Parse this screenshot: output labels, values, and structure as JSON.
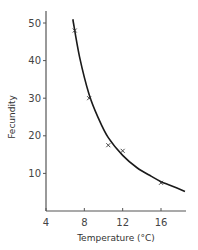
{
  "chart_data": {
    "type": "line",
    "title": "",
    "xlabel": "Temperature (°C)",
    "ylabel": "Fecundity",
    "xlim": [
      4,
      19
    ],
    "ylim": [
      0,
      53
    ],
    "x_ticks": [
      4,
      8,
      12,
      16
    ],
    "y_ticks": [
      10,
      20,
      30,
      40,
      50
    ],
    "grid": false,
    "legend": null,
    "series": [
      {
        "name": "observed",
        "style": "scatter-x",
        "x": [
          7,
          8.5,
          10.5,
          12,
          16
        ],
        "y": [
          48,
          30,
          17.5,
          16,
          7.5
        ]
      },
      {
        "name": "fitted curve",
        "style": "line",
        "x": [
          6.8,
          7.5,
          8.5,
          9.5,
          10.5,
          12,
          13.5,
          15,
          16,
          17,
          18.5
        ],
        "y": [
          51,
          41,
          31,
          24.5,
          19.5,
          14.8,
          11.5,
          9.2,
          7.8,
          6.8,
          5.2
        ]
      }
    ]
  }
}
